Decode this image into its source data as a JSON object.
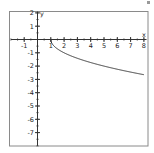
{
  "chart_data": {
    "type": "line",
    "title": "",
    "xlabel": "x",
    "ylabel": "y",
    "function": "y = -sqrt(x - 1)",
    "xlim": [
      -2,
      8.2
    ],
    "ylim": [
      -8,
      2.1
    ],
    "x_ticks": [
      -1,
      1,
      2,
      3,
      4,
      5,
      6,
      7,
      8
    ],
    "y_ticks": [
      2,
      1,
      -1,
      -2,
      -3,
      -4,
      -5,
      -6,
      -7
    ],
    "minor_tick_step": 0.5,
    "grid": false,
    "legend": null,
    "series": [
      {
        "name": "y = -sqrt(x-1)",
        "x": [
          1,
          1.25,
          1.5,
          2,
          2.5,
          3,
          3.5,
          4,
          4.5,
          5,
          5.5,
          6,
          6.5,
          7,
          7.5,
          8
        ],
        "values": [
          0,
          -0.5,
          -0.71,
          -1,
          -1.22,
          -1.41,
          -1.58,
          -1.73,
          -1.87,
          -2,
          -2.12,
          -2.24,
          -2.35,
          -2.45,
          -2.55,
          -2.65
        ]
      }
    ]
  },
  "colors": {
    "frame": "#8a8a8a",
    "axis": "#333333",
    "curve": "#333333",
    "background": "#ffffff"
  }
}
